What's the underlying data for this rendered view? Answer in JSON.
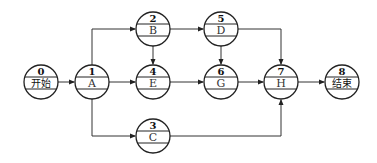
{
  "diagram": {
    "type": "activity-on-node network",
    "nodes": [
      {
        "id": "0",
        "label": "开始",
        "cx": 41,
        "cy": 82
      },
      {
        "id": "1",
        "label": "A",
        "cx": 92,
        "cy": 82
      },
      {
        "id": "2",
        "label": "B",
        "cx": 153,
        "cy": 29
      },
      {
        "id": "4",
        "label": "E",
        "cx": 153,
        "cy": 82
      },
      {
        "id": "3",
        "label": "C",
        "cx": 153,
        "cy": 136
      },
      {
        "id": "5",
        "label": "D",
        "cx": 221,
        "cy": 29
      },
      {
        "id": "6",
        "label": "G",
        "cx": 221,
        "cy": 82
      },
      {
        "id": "7",
        "label": "H",
        "cx": 281,
        "cy": 82
      },
      {
        "id": "8",
        "label": "结束",
        "cx": 342,
        "cy": 82
      }
    ],
    "edges": [
      {
        "from": "0",
        "to": "1"
      },
      {
        "from": "1",
        "to": "2"
      },
      {
        "from": "1",
        "to": "4"
      },
      {
        "from": "1",
        "to": "3"
      },
      {
        "from": "2",
        "to": "4"
      },
      {
        "from": "2",
        "to": "5"
      },
      {
        "from": "4",
        "to": "6"
      },
      {
        "from": "5",
        "to": "6"
      },
      {
        "from": "5",
        "to": "7"
      },
      {
        "from": "6",
        "to": "7"
      },
      {
        "from": "3",
        "to": "7"
      },
      {
        "from": "7",
        "to": "8"
      }
    ]
  }
}
